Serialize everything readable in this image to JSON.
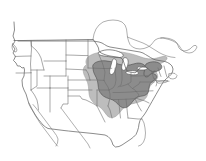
{
  "map": {
    "title": "North America species range map",
    "projection_note": "Conterminous United States with southern Canada and northern Mexico outlines",
    "background_color": "#ffffff",
    "width": 206,
    "height": 161,
    "legend_visible": false,
    "labels_visible": false,
    "layers": [
      {
        "name": "outer-range",
        "label": "Outer range (peripheral distribution)",
        "fill_color": "#bdbdbd",
        "stroke_color": "#9a9a9a",
        "description": "Light gray halo extending from eastern Minnesota and Iowa across the Great Lakes, southern Ontario and Quebec to New England, and south to the Gulf coastal plain margin"
      },
      {
        "name": "core-range",
        "label": "Core range (primary distribution)",
        "fill_color": "#8c8c8c",
        "stroke_color": "#4a4a4a",
        "description": "Darker gray core covering Wisconsin, Michigan, Illinois, Indiana, Ohio, Kentucky, Tennessee, West Virginia, Virginia, Pennsylvania, New York, and southern New England"
      },
      {
        "name": "state-boundaries",
        "label": "State boundaries",
        "fill_color": "none",
        "stroke_color": "#6e6e6e",
        "description": "Thin gray internal boundary lines for the conterminous United States"
      },
      {
        "name": "coastline",
        "label": "Coastline and national border",
        "fill_color": "none",
        "stroke_color": "#5a5a5a",
        "description": "Outline of the conterminous United States including Great Lakes shorelines"
      },
      {
        "name": "neighboring-countries",
        "label": "Canada and Mexico outlines",
        "fill_color": "none",
        "stroke_color": "#7a7a7a",
        "description": "Partial outlines of southern Canada, Nova Scotia, and the Baja California peninsula of Mexico"
      }
    ],
    "regions_shaded_core": [
      "Wisconsin",
      "Michigan",
      "Illinois",
      "Indiana",
      "Ohio",
      "Kentucky",
      "Tennessee",
      "West Virginia",
      "Virginia",
      "Pennsylvania",
      "New York",
      "New Jersey",
      "Maryland",
      "Delaware",
      "Connecticut",
      "Massachusetts",
      "Rhode Island",
      "North Carolina",
      "Missouri",
      "Iowa",
      "Minnesota"
    ],
    "regions_shaded_outer": [
      "Minnesota",
      "Iowa",
      "Missouri",
      "Arkansas",
      "Alabama",
      "Georgia",
      "South Carolina",
      "Vermont",
      "New Hampshire",
      "Maine",
      "Southern Ontario",
      "Southern Quebec"
    ],
    "regions_unshaded": [
      "Washington",
      "Oregon",
      "California",
      "Idaho",
      "Nevada",
      "Montana",
      "Wyoming",
      "Utah",
      "Arizona",
      "Colorado",
      "New Mexico",
      "North Dakota",
      "South Dakota",
      "Nebraska",
      "Kansas",
      "Oklahoma",
      "Texas",
      "Louisiana",
      "Mississippi",
      "Florida"
    ]
  }
}
